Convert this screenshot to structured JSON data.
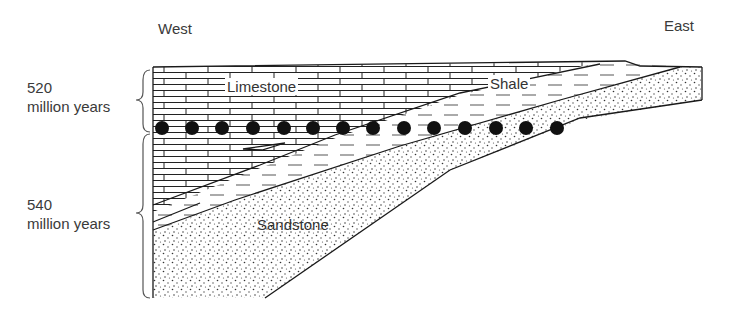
{
  "directions": {
    "west": "West",
    "east": "East"
  },
  "ages": [
    {
      "value": "520",
      "unit": "million years"
    },
    {
      "value": "540",
      "unit": "million years"
    }
  ],
  "layers": [
    {
      "name": "Limestone",
      "pattern": "brick"
    },
    {
      "name": "Shale",
      "pattern": "dashed"
    },
    {
      "name": "Sandstone",
      "pattern": "stipple"
    }
  ],
  "time_line": {
    "marker": "filled-circle",
    "count": 14
  },
  "colors": {
    "ink": "#1a1a1a",
    "text": "#3a3a3a",
    "background": "#ffffff"
  }
}
